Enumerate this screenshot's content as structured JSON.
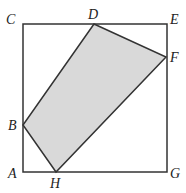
{
  "diagram": {
    "square": {
      "corners": [
        "C",
        "E",
        "G",
        "A"
      ]
    },
    "shaded_polygon": {
      "vertices": [
        "D",
        "F",
        "H",
        "B"
      ],
      "fill": "#d9d9d9"
    },
    "stroke_color": "#333333",
    "labels": {
      "A": "A",
      "B": "B",
      "C": "C",
      "D": "D",
      "E": "E",
      "F": "F",
      "G": "G",
      "H": "H"
    }
  }
}
